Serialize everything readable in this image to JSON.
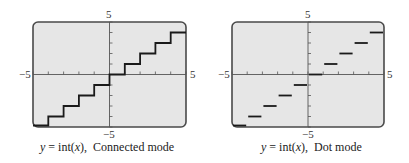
{
  "chart_data": [
    {
      "type": "line",
      "title": "y = int(x), Connected mode",
      "function": "y = int(x)",
      "mode": "Connected mode",
      "xlabel": "",
      "ylabel": "",
      "xlim": [
        -5,
        5
      ],
      "ylim": [
        -5,
        5
      ],
      "x_tick_labels": [
        "-5",
        "5"
      ],
      "y_tick_labels": [
        "-5",
        "5"
      ],
      "x_ticks": [
        -5,
        -4,
        -3,
        -2,
        -1,
        0,
        1,
        2,
        3,
        4,
        5
      ],
      "y_ticks": [
        -5,
        -4,
        -3,
        -2,
        -1,
        0,
        1,
        2,
        3,
        4,
        5
      ],
      "grid": false,
      "steps": [
        {
          "x": [
            -5,
            -4
          ],
          "y": -5
        },
        {
          "x": [
            -4,
            -3
          ],
          "y": -4
        },
        {
          "x": [
            -3,
            -2
          ],
          "y": -3
        },
        {
          "x": [
            -2,
            -1
          ],
          "y": -2
        },
        {
          "x": [
            -1,
            0
          ],
          "y": -1
        },
        {
          "x": [
            0,
            1
          ],
          "y": 0
        },
        {
          "x": [
            1,
            2
          ],
          "y": 1
        },
        {
          "x": [
            2,
            3
          ],
          "y": 2
        },
        {
          "x": [
            3,
            4
          ],
          "y": 3
        },
        {
          "x": [
            4,
            5
          ],
          "y": 4
        }
      ],
      "connected": true
    },
    {
      "type": "line",
      "title": "y = int(x), Dot mode",
      "function": "y = int(x)",
      "mode": "Dot mode",
      "xlabel": "",
      "ylabel": "",
      "xlim": [
        -5,
        5
      ],
      "ylim": [
        -5,
        5
      ],
      "x_tick_labels": [
        "-5",
        "5"
      ],
      "y_tick_labels": [
        "-5",
        "5"
      ],
      "x_ticks": [
        -5,
        -4,
        -3,
        -2,
        -1,
        0,
        1,
        2,
        3,
        4,
        5
      ],
      "y_ticks": [
        -5,
        -4,
        -3,
        -2,
        -1,
        0,
        1,
        2,
        3,
        4,
        5
      ],
      "grid": false,
      "steps": [
        {
          "x": [
            -5,
            -4
          ],
          "y": -5
        },
        {
          "x": [
            -4,
            -3
          ],
          "y": -4
        },
        {
          "x": [
            -3,
            -2
          ],
          "y": -3
        },
        {
          "x": [
            -2,
            -1
          ],
          "y": -2
        },
        {
          "x": [
            -1,
            0
          ],
          "y": -1
        },
        {
          "x": [
            0,
            1
          ],
          "y": 0
        },
        {
          "x": [
            1,
            2
          ],
          "y": 1
        },
        {
          "x": [
            2,
            3
          ],
          "y": 2
        },
        {
          "x": [
            3,
            4
          ],
          "y": 3
        },
        {
          "x": [
            4,
            5
          ],
          "y": 4
        }
      ],
      "connected": false
    }
  ],
  "panels": [
    {
      "y_top_label": "5",
      "y_bottom_label": "−5",
      "x_left_label": "−5",
      "x_right_label": "5",
      "caption_y": "y",
      "caption_eq": " = int(",
      "caption_x": "x",
      "caption_close": "),",
      "caption_mode": "Connected mode"
    },
    {
      "y_top_label": "5",
      "y_bottom_label": "−5",
      "x_left_label": "−5",
      "x_right_label": "5",
      "caption_y": "y",
      "caption_eq": " = int(",
      "caption_x": "x",
      "caption_close": "),",
      "caption_mode": "Dot mode"
    }
  ],
  "colors": {
    "screen": "#e6e6e6",
    "frame": "#4a4a4a",
    "axis": "#555555",
    "plot": "#1a1a1a"
  }
}
